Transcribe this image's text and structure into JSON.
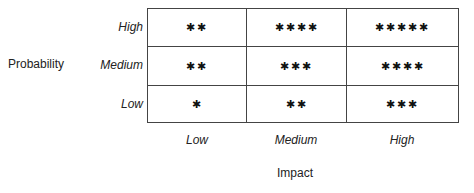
{
  "y_axis": {
    "label": "Probability",
    "levels": [
      "High",
      "Medium",
      "Low"
    ]
  },
  "x_axis": {
    "label": "Impact",
    "levels": [
      "Low",
      "Medium",
      "High"
    ]
  },
  "matrix": [
    [
      "✱✱",
      "✱✱✱✱",
      "✱✱✱✱✱"
    ],
    [
      "✱✱",
      "✱✱✱",
      "✱✱✱✱"
    ],
    [
      "✱",
      "✱✱",
      "✱✱✱"
    ]
  ],
  "star_counts": [
    [
      2,
      4,
      5
    ],
    [
      2,
      3,
      4
    ],
    [
      1,
      2,
      3
    ]
  ]
}
